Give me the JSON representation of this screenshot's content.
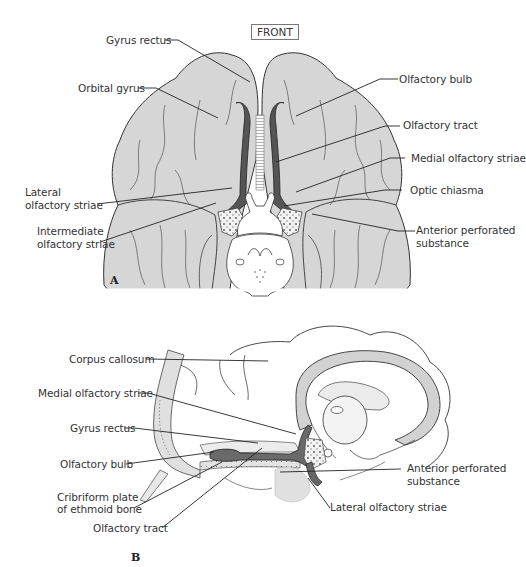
{
  "figure": {
    "orientation_label": "FRONT",
    "panels": [
      {
        "letter": "A",
        "view": "inferior (base of brain)",
        "labels_left": [
          "Gyrus rectus",
          "Orbital gyrus",
          "Lateral\nolfactory striae",
          "Intermediate\nolfactory striae"
        ],
        "labels_right": [
          "Olfactory bulb",
          "Olfactory tract",
          "Medial olfactory striae",
          "Optic chiasma",
          "Anterior perforated\nsubstance"
        ]
      },
      {
        "letter": "B",
        "view": "sagittal",
        "labels_left": [
          "Corpus callosum",
          "Medial olfactory striae",
          "Gyrus rectus",
          "Olfactory bulb",
          "Cribriform plate\nof ethmoid bone",
          "Olfactory tract"
        ],
        "labels_right": [
          "Anterior perforated\nsubstance",
          "Lateral olfactory striae"
        ]
      }
    ]
  },
  "panelA": {
    "letter": "A",
    "gyrus_rectus": "Gyrus rectus",
    "orbital_gyrus": "Orbital gyrus",
    "lateral_striae_1": "Lateral",
    "lateral_striae_2": "olfactory striae",
    "intermediate_striae_1": "Intermediate",
    "intermediate_striae_2": "olfactory striae",
    "olfactory_bulb": "Olfactory bulb",
    "olfactory_tract": "Olfactory tract",
    "medial_striae": "Medial olfactory striae",
    "optic_chiasma": "Optic chiasma",
    "ant_perf_1": "Anterior perforated",
    "ant_perf_2": "substance"
  },
  "panelB": {
    "letter": "B",
    "corpus_callosum": "Corpus callosum",
    "medial_striae": "Medial olfactory striae",
    "gyrus_rectus": "Gyrus rectus",
    "olfactory_bulb": "Olfactory bulb",
    "cribriform_1": "Cribriform plate",
    "cribriform_2": "of ethmoid bone",
    "olfactory_tract": "Olfactory tract",
    "ant_perf_1": "Anterior perforated",
    "ant_perf_2": "substance",
    "lateral_striae": "Lateral olfactory striae"
  },
  "colors": {
    "brain_fill": "#d9d9d9",
    "olfactory_dark": "#555555",
    "outline": "#333333",
    "leader_line": "#222222",
    "light_fill": "#ececec"
  }
}
